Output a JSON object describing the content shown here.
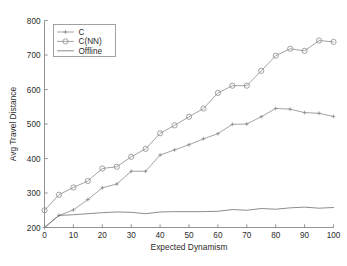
{
  "chart_data": {
    "type": "line",
    "title": "",
    "xlabel": "Expected Dynamism",
    "ylabel": "Avg Travel Distance",
    "xlim": [
      0,
      100
    ],
    "ylim": [
      200,
      800
    ],
    "xticks": [
      0,
      10,
      20,
      30,
      40,
      50,
      60,
      70,
      80,
      90,
      100
    ],
    "yticks": [
      200,
      300,
      400,
      500,
      600,
      700,
      800
    ],
    "xtick_labels": [
      "0",
      "10",
      "20",
      "30",
      "40",
      "50",
      "60",
      "70",
      "80",
      "90",
      "100"
    ],
    "ytick_labels": [
      "200",
      "300",
      "400",
      "500",
      "600",
      "700",
      "800"
    ],
    "grid": false,
    "legend_position": "upper-left",
    "x": [
      0,
      5,
      10,
      15,
      20,
      25,
      30,
      35,
      40,
      45,
      50,
      55,
      60,
      65,
      70,
      75,
      80,
      85,
      90,
      95,
      100
    ],
    "series": [
      {
        "name": "C",
        "marker": "cross",
        "color": "#8c8c8c",
        "values": [
          200,
          235,
          251,
          281,
          315,
          326,
          363,
          363,
          410,
          425,
          440,
          457,
          472,
          499,
          500,
          521,
          545,
          543,
          533,
          531,
          522
        ]
      },
      {
        "name": "C(NN)",
        "marker": "circle",
        "color": "#8c8c8c",
        "values": [
          250,
          295,
          316,
          335,
          371,
          376,
          405,
          428,
          473,
          496,
          521,
          545,
          590,
          611,
          611,
          654,
          698,
          718,
          712,
          742,
          738
        ]
      },
      {
        "name": "Offline",
        "marker": "none",
        "color": "#6e6e6e",
        "values": [
          200,
          235,
          237,
          240,
          243,
          245,
          244,
          240,
          245,
          246,
          246,
          246,
          247,
          252,
          250,
          255,
          253,
          257,
          259,
          256,
          258
        ]
      }
    ]
  },
  "legend": {
    "entries": [
      {
        "label": "C"
      },
      {
        "label": "C(NN)"
      },
      {
        "label": "Offline"
      }
    ]
  }
}
